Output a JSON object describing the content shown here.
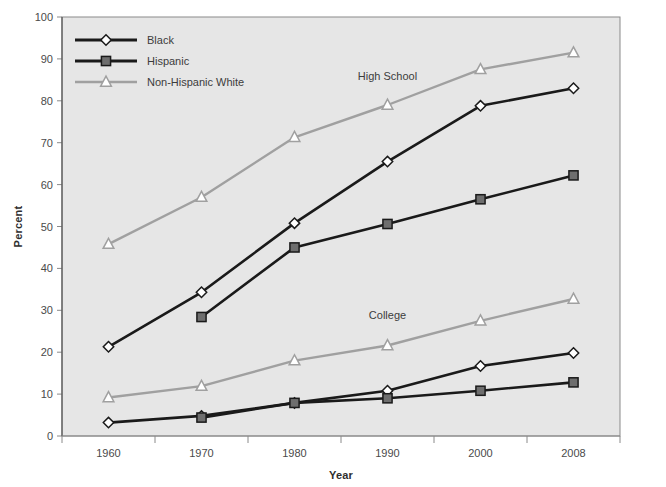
{
  "chart_data": {
    "type": "line",
    "title": "",
    "xlabel": "Year",
    "ylabel": "Percent",
    "categories": [
      "1960",
      "1970",
      "1980",
      "1990",
      "2000",
      "2008"
    ],
    "x": [
      1960,
      1970,
      1980,
      1990,
      2000,
      2008
    ],
    "ylim": [
      0,
      100
    ],
    "ytick_values": [
      0,
      10,
      20,
      30,
      40,
      50,
      60,
      70,
      80,
      90,
      100
    ],
    "ytick_labels": [
      "0",
      "10",
      "20",
      "30",
      "40",
      "50",
      "60",
      "70",
      "80",
      "90",
      "100"
    ],
    "grid": false,
    "legend_position": "top-left",
    "annotations": [
      {
        "text": "High School",
        "x": 1990,
        "y": 85
      },
      {
        "text": "College",
        "x": 1990,
        "y": 28
      }
    ],
    "groups": [
      "High School",
      "College"
    ],
    "series": [
      {
        "name": "Black",
        "group": "High School",
        "color": "#1a1a1a",
        "marker": "diamond",
        "marker_fill": "#ffffff",
        "values": [
          21.3,
          34.3,
          50.8,
          65.5,
          78.8,
          83.0
        ]
      },
      {
        "name": "Hispanic",
        "group": "High School",
        "color": "#1a1a1a",
        "marker": "square",
        "marker_fill": "#6e6e6e",
        "values": [
          null,
          28.4,
          45.0,
          50.6,
          56.5,
          62.2
        ]
      },
      {
        "name": "Non-Hispanic White",
        "group": "High School",
        "color": "#a0a0a0",
        "marker": "triangle",
        "marker_fill": "#ffffff",
        "values": [
          45.8,
          57.0,
          71.3,
          79.0,
          87.5,
          91.5
        ]
      },
      {
        "name": "Black",
        "group": "College",
        "color": "#1a1a1a",
        "marker": "diamond",
        "marker_fill": "#ffffff",
        "values": [
          3.2,
          4.8,
          7.9,
          10.8,
          16.7,
          19.8
        ]
      },
      {
        "name": "Hispanic",
        "group": "College",
        "color": "#1a1a1a",
        "marker": "square",
        "marker_fill": "#6e6e6e",
        "values": [
          null,
          4.4,
          7.9,
          9.0,
          10.8,
          12.8
        ]
      },
      {
        "name": "Non-Hispanic White",
        "group": "College",
        "color": "#a0a0a0",
        "marker": "triangle",
        "marker_fill": "#ffffff",
        "values": [
          9.2,
          11.9,
          18.0,
          21.6,
          27.5,
          32.7
        ]
      }
    ],
    "legend": [
      {
        "label": "Black",
        "color": "#1a1a1a",
        "marker": "diamond",
        "marker_fill": "#ffffff"
      },
      {
        "label": "Hispanic",
        "color": "#1a1a1a",
        "marker": "square",
        "marker_fill": "#6e6e6e"
      },
      {
        "label": "Non-Hispanic White",
        "color": "#a0a0a0",
        "marker": "triangle",
        "marker_fill": "#ffffff"
      }
    ],
    "colors": {
      "plot_background": "#e6e6e6",
      "page_background": "#ffffff",
      "axis": "#8a8a8a",
      "text": "#3a3a3a",
      "black_series": "#1a1a1a",
      "hispanic_marker": "#6e6e6e",
      "white_series": "#a0a0a0"
    }
  }
}
